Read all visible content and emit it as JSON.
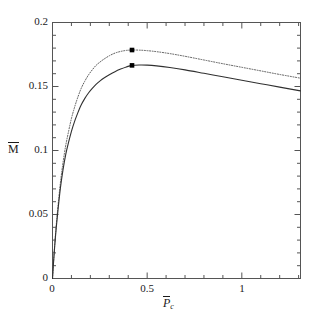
{
  "chart_data": {
    "type": "line",
    "title": "",
    "subtitle": "",
    "xlabel": "P̄c",
    "ylabel": "M̄",
    "xlim": [
      0,
      1.31
    ],
    "ylim": [
      0,
      0.2
    ],
    "grid": false,
    "legend": "none",
    "background_color": "#ffffff",
    "axis_color": "#555555",
    "xticks": [
      0,
      0.5,
      1
    ],
    "xtick_labels": [
      "0",
      "0.5",
      "1"
    ],
    "x_minor_tick_step": 0.1,
    "yticks": [
      0,
      0.05,
      0.1,
      0.15,
      0.2
    ],
    "ytick_labels": [
      "0",
      "0.05",
      "0.1",
      "0.15",
      "0.2"
    ],
    "y_minor_tick_step": 0.01,
    "series": [
      {
        "name": "upper",
        "style": "dotted",
        "color": "#5a5a5a",
        "marker": "square",
        "marker_color": "#000000",
        "marker_point": {
          "x": 0.42,
          "y": 0.1785
        },
        "x": [
          0.0,
          0.005,
          0.012,
          0.02,
          0.03,
          0.042,
          0.055,
          0.07,
          0.085,
          0.1,
          0.115,
          0.13,
          0.15,
          0.17,
          0.19,
          0.21,
          0.23,
          0.25,
          0.27,
          0.3,
          0.33,
          0.36,
          0.39,
          0.42,
          0.46,
          0.5,
          0.55,
          0.62,
          0.7,
          0.8,
          0.9,
          1.0,
          1.1,
          1.2,
          1.31
        ],
        "y": [
          0.0,
          0.012,
          0.027,
          0.042,
          0.058,
          0.075,
          0.09,
          0.104,
          0.115,
          0.125,
          0.133,
          0.14,
          0.148,
          0.154,
          0.159,
          0.163,
          0.1665,
          0.169,
          0.1712,
          0.174,
          0.1761,
          0.1774,
          0.1782,
          0.1785,
          0.1784,
          0.178,
          0.1772,
          0.1757,
          0.1736,
          0.1707,
          0.1678,
          0.165,
          0.1622,
          0.1594,
          0.1565
        ]
      },
      {
        "name": "lower",
        "style": "solid",
        "color": "#303030",
        "marker": "square",
        "marker_color": "#000000",
        "marker_point": {
          "x": 0.42,
          "y": 0.1665
        },
        "x": [
          0.0,
          0.005,
          0.012,
          0.02,
          0.03,
          0.042,
          0.055,
          0.07,
          0.085,
          0.1,
          0.115,
          0.13,
          0.15,
          0.17,
          0.19,
          0.21,
          0.23,
          0.25,
          0.27,
          0.3,
          0.33,
          0.36,
          0.39,
          0.42,
          0.46,
          0.5,
          0.55,
          0.62,
          0.7,
          0.8,
          0.9,
          1.0,
          1.1,
          1.2,
          1.31
        ],
        "y": [
          0.0,
          0.0115,
          0.026,
          0.04,
          0.055,
          0.071,
          0.0845,
          0.097,
          0.1065,
          0.115,
          0.122,
          0.128,
          0.1352,
          0.1405,
          0.1449,
          0.1485,
          0.1516,
          0.1542,
          0.1565,
          0.1592,
          0.1616,
          0.1636,
          0.1653,
          0.1665,
          0.1668,
          0.1667,
          0.1661,
          0.1648,
          0.163,
          0.1603,
          0.1576,
          0.1549,
          0.1522,
          0.1495,
          0.1466
        ]
      }
    ]
  },
  "axes": {
    "y_title_markup": "M",
    "x_title_markup": "P",
    "x_title_subscript": "c"
  }
}
